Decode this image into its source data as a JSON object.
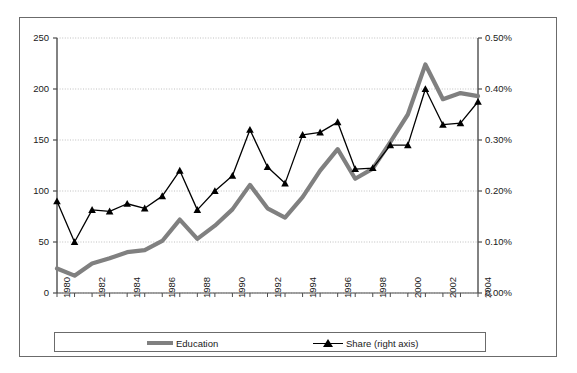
{
  "chart_data": {
    "type": "line",
    "title": "",
    "subtitle": "",
    "xlabel": "",
    "ylabel": "",
    "y2label": "",
    "grid": true,
    "legend_position": "bottom",
    "x": [
      1980,
      1981,
      1982,
      1983,
      1984,
      1985,
      1986,
      1987,
      1988,
      1989,
      1990,
      1991,
      1992,
      1993,
      1994,
      1995,
      1996,
      1997,
      1998,
      1999,
      2000,
      2001,
      2002,
      2003,
      2004
    ],
    "xtick_labels": [
      "1980",
      "1982",
      "1984",
      "1986",
      "1988",
      "1990",
      "1992",
      "1994",
      "1996",
      "1998",
      "2000",
      "2002",
      "2004"
    ],
    "ylim": [
      0,
      250
    ],
    "ytick_labels": [
      "0",
      "50",
      "100",
      "150",
      "200",
      "250"
    ],
    "ytick_values": [
      0,
      50,
      100,
      150,
      200,
      250
    ],
    "y2lim": [
      0,
      0.5
    ],
    "y2tick_labels": [
      "0.00%",
      "0.10%",
      "0.20%",
      "0.30%",
      "0.40%",
      "0.50%"
    ],
    "y2tick_values": [
      0.0,
      0.1,
      0.2,
      0.3,
      0.4,
      0.5
    ],
    "series": [
      {
        "name": "Education",
        "axis": "left",
        "color": "#808080",
        "marker": "none",
        "values": [
          24,
          17,
          29,
          34,
          40,
          42,
          51,
          72,
          53,
          66,
          82,
          106,
          83,
          74,
          94,
          120,
          141,
          112,
          122,
          148,
          175,
          224,
          190,
          196,
          193
        ]
      },
      {
        "name": "Share (right axis)",
        "axis": "right",
        "color": "#000000",
        "marker": "triangle",
        "values": [
          0.18,
          0.1,
          0.163,
          0.16,
          0.175,
          0.166,
          0.19,
          0.24,
          0.163,
          0.2,
          0.23,
          0.32,
          0.247,
          0.215,
          0.31,
          0.315,
          0.335,
          0.243,
          0.245,
          0.29,
          0.29,
          0.4,
          0.33,
          0.333,
          0.375
        ]
      }
    ]
  },
  "legend": {
    "items": [
      {
        "label": "Education",
        "kind": "line"
      },
      {
        "label": "Share (right axis)",
        "kind": "marker-line"
      }
    ]
  },
  "colors": {
    "education_line": "#808080",
    "share_line": "#000000",
    "grid": "#b0b0b0",
    "axis": "#4d4d4d",
    "frame": "#6b6b6b",
    "text": "#1a1a1a"
  }
}
